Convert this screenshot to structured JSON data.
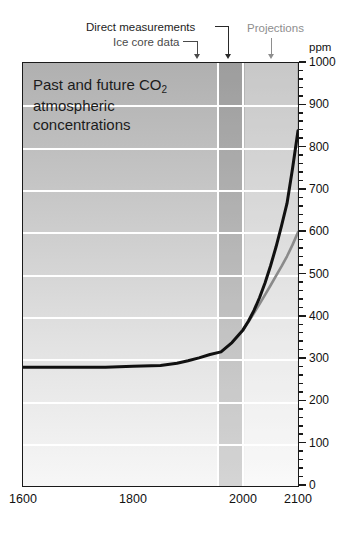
{
  "chart_data": {
    "type": "line",
    "title": "Past and future CO2 atmospheric concentrations",
    "title_line1": "Past and future CO",
    "title_sub": "2",
    "title_line2": "atmospheric",
    "title_line3": "concentrations",
    "xlabel": "",
    "ylabel": "ppm",
    "xlim": [
      1600,
      2100
    ],
    "ylim": [
      0,
      1000
    ],
    "grid": true,
    "legend_position": "none",
    "x_ticks": [
      "1600",
      "1800",
      "2000",
      "2100"
    ],
    "x_tick_values": [
      1600,
      1800,
      2000,
      2100
    ],
    "y_ticks": [
      "0",
      "100",
      "200",
      "300",
      "400",
      "500",
      "600",
      "700",
      "800",
      "900",
      "1000"
    ],
    "y_tick_values": [
      0,
      100,
      200,
      300,
      400,
      500,
      600,
      700,
      800,
      900,
      1000
    ],
    "y_minor_step": 20,
    "series": [
      {
        "name": "high projection",
        "color": "#111111",
        "x": [
          1600,
          1650,
          1700,
          1750,
          1800,
          1850,
          1880,
          1900,
          1920,
          1940,
          1960,
          1980,
          1990,
          2000,
          2010,
          2020,
          2030,
          2040,
          2050,
          2060,
          2070,
          2080,
          2090,
          2100
        ],
        "values": [
          281,
          281,
          281,
          281,
          283,
          285,
          290,
          296,
          303,
          311,
          317,
          339,
          354,
          369,
          390,
          415,
          445,
          480,
          520,
          565,
          615,
          668,
          750,
          840
        ]
      },
      {
        "name": "low projection",
        "color": "#8a8a8a",
        "x": [
          2000,
          2010,
          2020,
          2030,
          2040,
          2050,
          2060,
          2070,
          2080,
          2090,
          2100
        ],
        "values": [
          369,
          388,
          409,
          430,
          452,
          474,
          497,
          519,
          543,
          570,
          600
        ]
      }
    ],
    "bands": [
      {
        "name": "ice-core-data",
        "x0": 1600,
        "x1": 1958,
        "shade": "base"
      },
      {
        "name": "direct-measurements",
        "x0": 1958,
        "x1": 2000,
        "shade": "dark"
      },
      {
        "name": "projections",
        "x0": 2000,
        "x1": 2100,
        "shade": "light"
      }
    ],
    "annotations": [
      {
        "name": "direct-measurements",
        "text": "Direct measurements",
        "points_to_x": 1975,
        "color": "#1d1d1d"
      },
      {
        "name": "ice-core-data",
        "text": "Ice core data",
        "points_to_x": 1930,
        "color": "#4a4a4a"
      },
      {
        "name": "projections",
        "text": "Projections",
        "points_to_x": 2050,
        "color": "#8e8e8e"
      }
    ]
  },
  "axis": {
    "ppm_label": "ppm"
  }
}
